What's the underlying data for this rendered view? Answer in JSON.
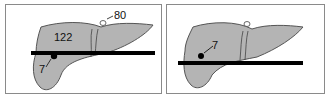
{
  "figure": {
    "panels": [
      {
        "id": "before",
        "labels": {
          "vessel": "80",
          "tumor_large": "122",
          "tumor_small": "7"
        }
      },
      {
        "id": "after",
        "labels": {
          "tumor_small": "7"
        }
      }
    ],
    "colors": {
      "organ_fill": "#b4b4b4",
      "outline": "#555555",
      "bar": "#000000",
      "border": "#8a8a8a"
    }
  }
}
